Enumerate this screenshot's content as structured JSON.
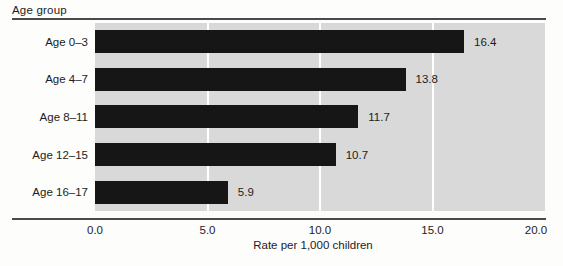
{
  "figure": {
    "y_axis_header": "Age group"
  },
  "chart_data": {
    "type": "bar",
    "orientation": "horizontal",
    "categories": [
      "Age 0–3",
      "Age 4–7",
      "Age 8–11",
      "Age 12–15",
      "Age 16–17"
    ],
    "values": [
      16.4,
      13.8,
      11.7,
      10.7,
      5.9
    ],
    "value_labels": [
      "16.4",
      "13.8",
      "11.7",
      "10.7",
      "5.9"
    ],
    "title": "",
    "xlabel": "Rate per 1,000 children",
    "ylabel": "Age group",
    "xlim": [
      0,
      20
    ],
    "x_ticks": [
      "0.0",
      "5.0",
      "10.0",
      "15.0",
      "20.0"
    ],
    "gridlines_at": [
      5.0,
      10.0,
      15.0
    ],
    "grid": "vertical white lines on shaded plot",
    "legend": "none"
  },
  "colors": {
    "bar": "#161616",
    "plot_background": "#d9d9d9",
    "gridline": "#ffffff",
    "rule": "#4a4a4a",
    "text": "#1c1c1c",
    "page_background": "#fdfdfc"
  }
}
